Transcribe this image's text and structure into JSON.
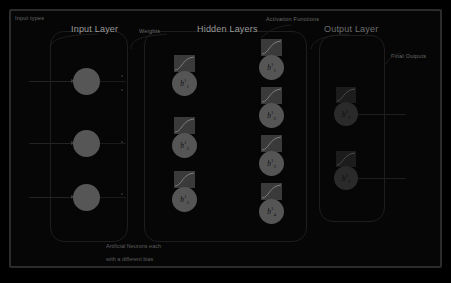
{
  "diagram": {
    "title_labels": {
      "input_types": "Input types",
      "input_layer": "Input Layer",
      "weights": "Weights",
      "hidden_layers": "Hidden Layers",
      "activation_functions": "Activation Functions",
      "output_layer": "Output Layer",
      "final_outputs": "Final Outputs"
    },
    "footnote_line1": "Artificial Neurons each",
    "footnote_line2": "with a different bias",
    "input_layer": {
      "neuron_count": 3,
      "neurons": [
        {
          "label": ""
        },
        {
          "label": ""
        },
        {
          "label": ""
        }
      ]
    },
    "hidden_column_1": {
      "neuron_count": 3,
      "neurons": [
        {
          "base": "b",
          "sup": "1",
          "sub": "1"
        },
        {
          "base": "b",
          "sup": "1",
          "sub": "2"
        },
        {
          "base": "b",
          "sup": "1",
          "sub": "3"
        }
      ]
    },
    "hidden_column_2": {
      "neuron_count": 4,
      "neurons": [
        {
          "base": "b",
          "sup": "1",
          "sub": "1"
        },
        {
          "base": "b",
          "sup": "1",
          "sub": "2"
        },
        {
          "base": "b",
          "sup": "1",
          "sub": "3"
        },
        {
          "base": "b",
          "sup": "1",
          "sub": "4"
        }
      ]
    },
    "output_layer": {
      "neuron_count": 2,
      "neurons": [
        {
          "base": "b",
          "sup": "2",
          "sub": "1"
        },
        {
          "base": "b",
          "sup": "2",
          "sub": "2"
        }
      ]
    },
    "colors": {
      "panel_background": "#060606",
      "frame": "#2b2b2b",
      "neuron_fill": "#555555",
      "neuron_fill_dim": "#2a2a2a",
      "activation_tile": "#3a3a3a",
      "group_outline": "#1d1d1d",
      "caption_text": "#9a9a9a",
      "small_caption_text": "#6a6a6a",
      "footnote_text": "#5e5e5e",
      "connection_line": "#232323"
    }
  }
}
